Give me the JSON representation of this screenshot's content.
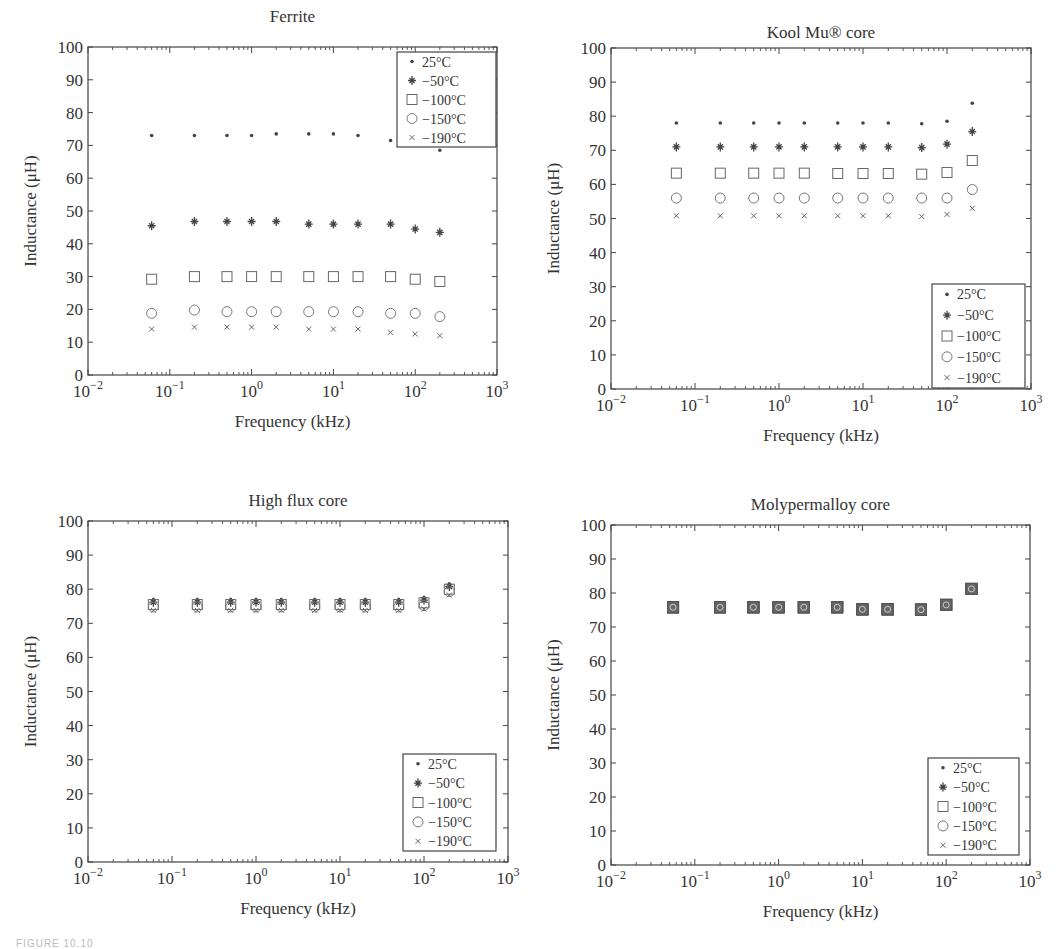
{
  "figure": {
    "caption_fragment": "FIGURE 10.10"
  },
  "legend_entries": [
    "25°C",
    "−50°C",
    "−100°C",
    "−150°C",
    "−190°C"
  ],
  "chart_data": [
    {
      "type": "scatter",
      "title": "Ferrite",
      "xlabel": "Frequency (kHz)",
      "ylabel": "Inductance (μH)",
      "xscale": "log",
      "xlim": [
        0.01,
        1000
      ],
      "ylim": [
        0,
        100
      ],
      "xticks": [
        "10⁻²",
        "10⁻¹",
        "10⁰",
        "10¹",
        "10²",
        "10³"
      ],
      "yticks": [
        0,
        10,
        20,
        30,
        40,
        50,
        60,
        70,
        80,
        90,
        100
      ],
      "legend_position": "upper right",
      "grid": false,
      "x": [
        0.06,
        0.2,
        0.5,
        1,
        2,
        5,
        10,
        20,
        50,
        100,
        200
      ],
      "series": [
        {
          "name": "25°C",
          "marker": "dot",
          "values": [
            73,
            73,
            73,
            73,
            73.5,
            73.5,
            73.5,
            73,
            71.5,
            null,
            68.5
          ]
        },
        {
          "name": "−50°C",
          "marker": "star",
          "values": [
            45.5,
            46.8,
            46.8,
            46.8,
            46.8,
            46,
            46,
            46,
            46,
            44.5,
            43.5
          ]
        },
        {
          "name": "−100°C",
          "marker": "square",
          "values": [
            29.2,
            30,
            30,
            30,
            30,
            30,
            30,
            30,
            30,
            29.2,
            28.5
          ]
        },
        {
          "name": "−150°C",
          "marker": "circle",
          "values": [
            18.8,
            19.8,
            19.3,
            19.3,
            19.3,
            19.3,
            19.3,
            19.3,
            18.8,
            18.8,
            17.8
          ]
        },
        {
          "name": "−190°C",
          "marker": "x",
          "values": [
            14,
            14.6,
            14.6,
            14.6,
            14.6,
            14,
            14,
            14,
            13,
            12.5,
            12
          ]
        }
      ]
    },
    {
      "type": "scatter",
      "title": "Kool Mu® core",
      "xlabel": "Frequency (kHz)",
      "ylabel": "Inductance (μH)",
      "xscale": "log",
      "xlim": [
        0.01,
        1000
      ],
      "ylim": [
        0,
        100
      ],
      "xticks": [
        "10⁻²",
        "10⁻¹",
        "10⁰",
        "10¹",
        "10²",
        "10³"
      ],
      "yticks": [
        0,
        10,
        20,
        30,
        40,
        50,
        60,
        70,
        80,
        90,
        100
      ],
      "legend_position": "lower right",
      "grid": false,
      "x": [
        0.06,
        0.2,
        0.5,
        1,
        2,
        5,
        10,
        20,
        50,
        100,
        200
      ],
      "series": [
        {
          "name": "25°C",
          "marker": "dot",
          "values": [
            78,
            78,
            78,
            78,
            78,
            78,
            78,
            78,
            77.8,
            78.5,
            83.8
          ]
        },
        {
          "name": "−50°C",
          "marker": "star",
          "values": [
            71,
            71,
            71,
            71,
            71,
            71,
            71,
            71,
            70.8,
            71.8,
            75.5
          ]
        },
        {
          "name": "−100°C",
          "marker": "square",
          "values": [
            63.3,
            63.3,
            63.3,
            63.3,
            63.3,
            63.2,
            63.2,
            63.2,
            63,
            63.5,
            67
          ]
        },
        {
          "name": "−150°C",
          "marker": "circle",
          "values": [
            56,
            56,
            56,
            56,
            56,
            56,
            56,
            56,
            56,
            56,
            58.5
          ]
        },
        {
          "name": "−190°C",
          "marker": "x",
          "values": [
            50.8,
            50.8,
            50.8,
            50.8,
            50.8,
            50.8,
            50.8,
            50.8,
            50.6,
            51.2,
            53
          ]
        }
      ]
    },
    {
      "type": "scatter",
      "title": "High flux core",
      "xlabel": "Frequency (kHz)",
      "ylabel": "Inductance (μH)",
      "xscale": "log",
      "xlim": [
        0.01,
        1000
      ],
      "ylim": [
        0,
        100
      ],
      "xticks": [
        "10⁻²",
        "10⁻¹",
        "10⁰",
        "10¹",
        "10²",
        "10³"
      ],
      "yticks": [
        0,
        10,
        20,
        30,
        40,
        50,
        60,
        70,
        80,
        90,
        100
      ],
      "legend_position": "lower right",
      "grid": false,
      "x": [
        0.06,
        0.2,
        0.5,
        1,
        2,
        5,
        10,
        20,
        50,
        100,
        200
      ],
      "series": [
        {
          "name": "25°C",
          "marker": "dot",
          "values": [
            77,
            77,
            77,
            77,
            77,
            77,
            77,
            77,
            77,
            77.5,
            81.5
          ]
        },
        {
          "name": "−50°C",
          "marker": "star",
          "values": [
            76.2,
            76.2,
            76.2,
            76.2,
            76.2,
            76.2,
            76.2,
            76.2,
            76.2,
            76.8,
            80.8
          ]
        },
        {
          "name": "−100°C",
          "marker": "square",
          "values": [
            75.5,
            75.5,
            75.5,
            75.5,
            75.5,
            75.5,
            75.5,
            75.5,
            75.5,
            76,
            80
          ]
        },
        {
          "name": "−150°C",
          "marker": "circle",
          "values": [
            74.8,
            74.8,
            74.8,
            74.8,
            74.8,
            74.8,
            74.8,
            74.8,
            74.8,
            75.2,
            79.3
          ]
        },
        {
          "name": "−190°C",
          "marker": "x",
          "values": [
            73.8,
            73.8,
            73.8,
            73.8,
            73.8,
            73.8,
            73.8,
            73.8,
            73.8,
            74.2,
            78.3
          ]
        }
      ]
    },
    {
      "type": "scatter",
      "title": "Molypermalloy core",
      "xlabel": "Frequency (kHz)",
      "ylabel": "Inductance (μH)",
      "xscale": "log",
      "xlim": [
        0.01,
        1000
      ],
      "ylim": [
        0,
        100
      ],
      "xticks": [
        "10⁻²",
        "10⁻¹",
        "10⁰",
        "10¹",
        "10²",
        "10³"
      ],
      "yticks": [
        0,
        10,
        20,
        30,
        40,
        50,
        60,
        70,
        80,
        90,
        100
      ],
      "legend_position": "lower right",
      "grid": false,
      "x": [
        0.055,
        0.2,
        0.5,
        1,
        2,
        5,
        10,
        20,
        50,
        100,
        200
      ],
      "series": [
        {
          "name": "25°C",
          "marker": "dot",
          "values": [
            75.8,
            75.8,
            75.8,
            75.8,
            75.8,
            75.8,
            75.2,
            75.2,
            75.1,
            76.5,
            81.2
          ]
        },
        {
          "name": "−50°C",
          "marker": "star",
          "values": [
            75.8,
            75.8,
            75.8,
            75.8,
            75.8,
            75.8,
            75.2,
            75.2,
            75.1,
            76.5,
            81.2
          ]
        },
        {
          "name": "−100°C",
          "marker": "square",
          "values": [
            75.8,
            75.8,
            75.8,
            75.8,
            75.8,
            75.8,
            75.2,
            75.2,
            75.1,
            76.5,
            81.2
          ]
        },
        {
          "name": "−150°C",
          "marker": "circle",
          "values": [
            75.8,
            75.8,
            75.8,
            75.8,
            75.8,
            75.8,
            75.2,
            75.2,
            75.1,
            76.5,
            81.2
          ]
        },
        {
          "name": "−190°C",
          "marker": "x",
          "values": [
            75.8,
            75.8,
            75.8,
            75.8,
            75.8,
            75.8,
            75.2,
            75.2,
            75.1,
            76.5,
            81.2
          ]
        }
      ]
    }
  ],
  "layout": {
    "panels": [
      {
        "x0": 88,
        "x1": 497,
        "y0": 47,
        "y1": 375,
        "title_y": 22,
        "legend": {
          "x": 397,
          "y": 52,
          "w": 99,
          "h": 95
        }
      },
      {
        "x0": 611,
        "x1": 1031,
        "y0": 48,
        "y1": 389,
        "title_y": 38,
        "legend": {
          "x": 932,
          "y": 284,
          "w": 93,
          "h": 104
        }
      },
      {
        "x0": 88,
        "x1": 508,
        "y0": 521,
        "y1": 862,
        "title_y": 506,
        "legend": {
          "x": 403,
          "y": 754,
          "w": 93,
          "h": 97
        }
      },
      {
        "x0": 611,
        "x1": 1030,
        "y0": 525,
        "y1": 865,
        "title_y": 510,
        "legend": {
          "x": 928,
          "y": 758,
          "w": 91,
          "h": 97
        }
      }
    ]
  }
}
